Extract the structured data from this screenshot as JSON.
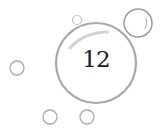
{
  "main_bubble": {
    "label": "12"
  },
  "colors": {
    "outline": "#a8a8a8",
    "highlight": "#d0d0d0",
    "text": "#1a1a1a"
  }
}
